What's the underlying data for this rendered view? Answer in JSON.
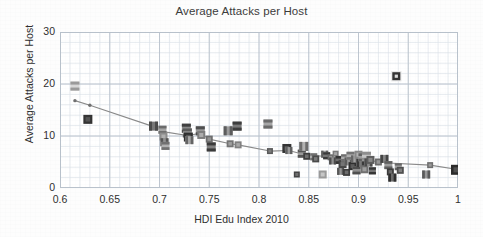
{
  "chart_data": {
    "type": "scatter",
    "title": "Average Attacks per Host",
    "xlabel": "HDI Edu Index 2010",
    "ylabel": "Average Attacks per Host",
    "xlim": [
      0.6,
      1.0
    ],
    "ylim": [
      0,
      30
    ],
    "xticks": [
      "0.6",
      "0.65",
      "0.7",
      "0.75",
      "0.8",
      "0.85",
      "0.9",
      "0.95",
      "1"
    ],
    "xtick_values": [
      0.6,
      0.65,
      0.7,
      0.75,
      0.8,
      0.85,
      0.9,
      0.95,
      1.0
    ],
    "yticks": [
      "0",
      "10",
      "20",
      "30"
    ],
    "ytick_values": [
      0,
      10,
      20,
      30
    ],
    "grid": true,
    "grid_minor": true,
    "grid_minor_x_step": 0.01,
    "grid_minor_y_step": 2,
    "legend": null,
    "marker_style": "flag-image-square",
    "note": "Markers are small country-flag thumbnails; grayscale/muted in this scan.",
    "series": [
      {
        "name": "Countries",
        "type": "scatter",
        "points": [
          {
            "x": 0.615,
            "y": 19.6,
            "size": 9,
            "tone": "#9a9a9a",
            "tone2": "#d8d8d8",
            "pattern": "hbar"
          },
          {
            "x": 0.628,
            "y": 13.2,
            "size": 9,
            "tone": "#333333",
            "tone2": "#5f5f5f",
            "pattern": "solid"
          },
          {
            "x": 0.694,
            "y": 11.9,
            "size": 9,
            "tone": "#4a4a4a",
            "tone2": "#777777",
            "pattern": "vbar"
          },
          {
            "x": 0.703,
            "y": 11.2,
            "size": 8,
            "tone": "#6b6b6b",
            "tone2": "#a5a5a5",
            "pattern": "hbar"
          },
          {
            "x": 0.704,
            "y": 9.9,
            "size": 8,
            "tone": "#8c8c8c",
            "tone2": "#bcbcbc",
            "pattern": "solid"
          },
          {
            "x": 0.705,
            "y": 8.8,
            "size": 8,
            "tone": "#555555",
            "tone2": "#909090",
            "pattern": "vbar"
          },
          {
            "x": 0.706,
            "y": 8.1,
            "size": 8,
            "tone": "#707070",
            "tone2": "#b0b0b0",
            "pattern": "hbar"
          },
          {
            "x": 0.727,
            "y": 11.5,
            "size": 9,
            "tone": "#3f3f3f",
            "tone2": "#8a8a8a",
            "pattern": "hbar"
          },
          {
            "x": 0.728,
            "y": 10.6,
            "size": 9,
            "tone": "#5a5a5a",
            "tone2": "#9e9e9e",
            "pattern": "hbar"
          },
          {
            "x": 0.729,
            "y": 9.8,
            "size": 9,
            "tone": "#2f2f2f",
            "tone2": "#6a6a6a",
            "pattern": "solid"
          },
          {
            "x": 0.73,
            "y": 9.2,
            "size": 8,
            "tone": "#646464",
            "tone2": "#a8a8a8",
            "pattern": "vbar"
          },
          {
            "x": 0.741,
            "y": 11.0,
            "size": 9,
            "tone": "#4e4e4e",
            "tone2": "#9a9a9a",
            "pattern": "hbar"
          },
          {
            "x": 0.742,
            "y": 10.2,
            "size": 8,
            "tone": "#7d7d7d",
            "tone2": "#bdbdbd",
            "pattern": "solid"
          },
          {
            "x": 0.75,
            "y": 9.4,
            "size": 7,
            "tone": "#6e6e6e",
            "tone2": "#a0a0a0",
            "pattern": "solid"
          },
          {
            "x": 0.752,
            "y": 7.9,
            "size": 9,
            "tone": "#3a3a3a",
            "tone2": "#808080",
            "pattern": "hbar"
          },
          {
            "x": 0.769,
            "y": 11.0,
            "size": 9,
            "tone": "#5c5c5c",
            "tone2": "#9c9c9c",
            "pattern": "vbar"
          },
          {
            "x": 0.771,
            "y": 8.5,
            "size": 7,
            "tone": "#747474",
            "tone2": "#adadad",
            "pattern": "solid"
          },
          {
            "x": 0.778,
            "y": 11.9,
            "size": 9,
            "tone": "#3c3c3c",
            "tone2": "#7a7a7a",
            "pattern": "hbar"
          },
          {
            "x": 0.779,
            "y": 8.3,
            "size": 7,
            "tone": "#808080",
            "tone2": "#b4b4b4",
            "pattern": "solid"
          },
          {
            "x": 0.809,
            "y": 12.3,
            "size": 9,
            "tone": "#6a6a6a",
            "tone2": "#a6a6a6",
            "pattern": "hbar"
          },
          {
            "x": 0.811,
            "y": 7.1,
            "size": 6,
            "tone": "#5a5a5a",
            "tone2": "#8a8a8a",
            "pattern": "solid"
          },
          {
            "x": 0.828,
            "y": 7.6,
            "size": 9,
            "tone": "#333333",
            "tone2": "#707070",
            "pattern": "solid"
          },
          {
            "x": 0.83,
            "y": 7.2,
            "size": 7,
            "tone": "#606060",
            "tone2": "#9b9b9b",
            "pattern": "vbar"
          },
          {
            "x": 0.838,
            "y": 2.6,
            "size": 6,
            "tone": "#444444",
            "tone2": "#7f7f7f",
            "pattern": "solid"
          },
          {
            "x": 0.843,
            "y": 6.6,
            "size": 8,
            "tone": "#555555",
            "tone2": "#9a9a9a",
            "pattern": "hbar"
          },
          {
            "x": 0.845,
            "y": 8.0,
            "size": 9,
            "tone": "#6c6c6c",
            "tone2": "#b2b2b2",
            "pattern": "vbar"
          },
          {
            "x": 0.848,
            "y": 6.1,
            "size": 7,
            "tone": "#3e3e3e",
            "tone2": "#828282",
            "pattern": "solid"
          },
          {
            "x": 0.855,
            "y": 6.0,
            "size": 7,
            "tone": "#707070",
            "tone2": "#ababab",
            "pattern": "hbar"
          },
          {
            "x": 0.857,
            "y": 5.6,
            "size": 7,
            "tone": "#4a4a4a",
            "tone2": "#8c8c8c",
            "pattern": "solid"
          },
          {
            "x": 0.864,
            "y": 2.6,
            "size": 8,
            "tone": "#9a9a9a",
            "tone2": "#d4d4d4",
            "pattern": "solid"
          },
          {
            "x": 0.866,
            "y": 6.5,
            "size": 7,
            "tone": "#5e5e5e",
            "tone2": "#9f9f9f",
            "pattern": "vbar"
          },
          {
            "x": 0.868,
            "y": 6.2,
            "size": 7,
            "tone": "#3a3a3a",
            "tone2": "#787878",
            "pattern": "hbar"
          },
          {
            "x": 0.872,
            "y": 5.9,
            "size": 6,
            "tone": "#686868",
            "tone2": "#a4a4a4",
            "pattern": "solid"
          },
          {
            "x": 0.874,
            "y": 5.2,
            "size": 7,
            "tone": "#4c4c4c",
            "tone2": "#909090",
            "pattern": "vbar"
          },
          {
            "x": 0.877,
            "y": 6.6,
            "size": 6,
            "tone": "#7a7a7a",
            "tone2": "#b6b6b6",
            "pattern": "solid"
          },
          {
            "x": 0.881,
            "y": 5.4,
            "size": 8,
            "tone": "#333333",
            "tone2": "#6e6e6e",
            "pattern": "hbar"
          },
          {
            "x": 0.882,
            "y": 3.2,
            "size": 7,
            "tone": "#585858",
            "tone2": "#979797",
            "pattern": "vbar"
          },
          {
            "x": 0.884,
            "y": 4.6,
            "size": 8,
            "tone": "#464646",
            "tone2": "#868686",
            "pattern": "solid"
          },
          {
            "x": 0.886,
            "y": 5.8,
            "size": 7,
            "tone": "#6f6f6f",
            "tone2": "#acacac",
            "pattern": "hbar"
          },
          {
            "x": 0.888,
            "y": 3.0,
            "size": 7,
            "tone": "#3d3d3d",
            "tone2": "#7c7c7c",
            "pattern": "solid"
          },
          {
            "x": 0.89,
            "y": 5.1,
            "size": 8,
            "tone": "#5b5b5b",
            "tone2": "#9b9b9b",
            "pattern": "vbar"
          },
          {
            "x": 0.892,
            "y": 6.2,
            "size": 8,
            "tone": "#737373",
            "tone2": "#b0b0b0",
            "pattern": "hbar"
          },
          {
            "x": 0.894,
            "y": 4.2,
            "size": 8,
            "tone": "#2f2f2f",
            "tone2": "#6b6b6b",
            "pattern": "solid"
          },
          {
            "x": 0.896,
            "y": 5.6,
            "size": 7,
            "tone": "#656565",
            "tone2": "#a2a2a2",
            "pattern": "vbar"
          },
          {
            "x": 0.898,
            "y": 3.4,
            "size": 8,
            "tone": "#4e4e4e",
            "tone2": "#8e8e8e",
            "pattern": "hbar"
          },
          {
            "x": 0.9,
            "y": 6.4,
            "size": 8,
            "tone": "#888888",
            "tone2": "#c0c0c0",
            "pattern": "solid"
          },
          {
            "x": 0.902,
            "y": 4.8,
            "size": 8,
            "tone": "#3a3a3a",
            "tone2": "#7a7a7a",
            "pattern": "vbar"
          },
          {
            "x": 0.904,
            "y": 5.9,
            "size": 8,
            "tone": "#606060",
            "tone2": "#9e9e9e",
            "pattern": "hbar"
          },
          {
            "x": 0.906,
            "y": 3.6,
            "size": 8,
            "tone": "#707070",
            "tone2": "#aeaeae",
            "pattern": "solid"
          },
          {
            "x": 0.908,
            "y": 6.1,
            "size": 9,
            "tone": "#8e8e8e",
            "tone2": "#c6c6c6",
            "pattern": "hbar"
          },
          {
            "x": 0.91,
            "y": 4.9,
            "size": 8,
            "tone": "#4a4a4a",
            "tone2": "#8b8b8b",
            "pattern": "vbar"
          },
          {
            "x": 0.912,
            "y": 5.4,
            "size": 8,
            "tone": "#5d5d5d",
            "tone2": "#9a9a9a",
            "pattern": "solid"
          },
          {
            "x": 0.914,
            "y": 3.3,
            "size": 7,
            "tone": "#353535",
            "tone2": "#737373",
            "pattern": "hbar"
          },
          {
            "x": 0.92,
            "y": 5.0,
            "size": 7,
            "tone": "#6a6a6a",
            "tone2": "#a7a7a7",
            "pattern": "solid"
          },
          {
            "x": 0.926,
            "y": 5.6,
            "size": 8,
            "tone": "#454545",
            "tone2": "#858585",
            "pattern": "vbar"
          },
          {
            "x": 0.93,
            "y": 4.4,
            "size": 8,
            "tone": "#5f5f5f",
            "tone2": "#9d9d9d",
            "pattern": "hbar"
          },
          {
            "x": 0.932,
            "y": 3.1,
            "size": 7,
            "tone": "#3b3b3b",
            "tone2": "#7b7b7b",
            "pattern": "solid"
          },
          {
            "x": 0.934,
            "y": 2.0,
            "size": 8,
            "tone": "#2e2e2e",
            "tone2": "#6c6c6c",
            "pattern": "vbar"
          },
          {
            "x": 0.938,
            "y": 21.5,
            "size": 8,
            "tone": "#333333",
            "tone2": "#bbbbbb",
            "pattern": "outlier"
          },
          {
            "x": 0.94,
            "y": 4.1,
            "size": 7,
            "tone": "#666666",
            "tone2": "#a3a3a3",
            "pattern": "hbar"
          },
          {
            "x": 0.942,
            "y": 3.4,
            "size": 7,
            "tone": "#4f4f4f",
            "tone2": "#8f8f8f",
            "pattern": "solid"
          },
          {
            "x": 0.968,
            "y": 2.6,
            "size": 8,
            "tone": "#5a5a5a",
            "tone2": "#999999",
            "pattern": "vbar"
          },
          {
            "x": 0.972,
            "y": 4.4,
            "size": 6,
            "tone": "#6e6e6e",
            "tone2": "#a9a9a9",
            "pattern": "solid"
          },
          {
            "x": 0.998,
            "y": 3.5,
            "size": 10,
            "tone": "#2b2b2b",
            "tone2": "#5e5e5e",
            "pattern": "solid"
          }
        ]
      },
      {
        "name": "Trend",
        "type": "line",
        "color": "#8a8a8a",
        "points": [
          {
            "x": 0.615,
            "y": 16.8
          },
          {
            "x": 0.63,
            "y": 15.9
          },
          {
            "x": 0.694,
            "y": 11.8
          },
          {
            "x": 0.705,
            "y": 10.8
          },
          {
            "x": 0.728,
            "y": 10.1
          },
          {
            "x": 0.741,
            "y": 10.5
          },
          {
            "x": 0.75,
            "y": 9.4
          },
          {
            "x": 0.771,
            "y": 8.5
          },
          {
            "x": 0.779,
            "y": 8.3
          },
          {
            "x": 0.811,
            "y": 7.1
          },
          {
            "x": 0.83,
            "y": 7.2
          },
          {
            "x": 0.848,
            "y": 6.3
          },
          {
            "x": 0.866,
            "y": 6.1
          },
          {
            "x": 0.886,
            "y": 5.7
          },
          {
            "x": 0.906,
            "y": 5.4
          },
          {
            "x": 0.93,
            "y": 4.8
          },
          {
            "x": 0.972,
            "y": 4.4
          },
          {
            "x": 0.998,
            "y": 3.6
          }
        ]
      }
    ]
  },
  "style": {
    "plot_bg": "#ffffff",
    "page_bg": "#fdfdfd",
    "grid_major": "#b9c2cc",
    "grid_minor": "#dde3ea",
    "axis_text": "#2e2e2e",
    "title_color": "#3b3b3b",
    "trend_color": "#8a8a8a"
  }
}
